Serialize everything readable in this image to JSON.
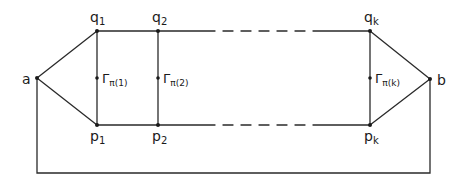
{
  "diagram": {
    "type": "graph",
    "stroke_color": "#2a2a2a",
    "vertices": {
      "a": {
        "label": "a",
        "x": 37,
        "y": 78
      },
      "b": {
        "label": "b",
        "x": 430,
        "y": 79
      },
      "q1": {
        "label": "q",
        "sub": "1",
        "x": 97,
        "y": 31
      },
      "p1": {
        "label": "p",
        "sub": "1",
        "x": 97,
        "y": 125
      },
      "q2": {
        "label": "q",
        "sub": "2",
        "x": 158,
        "y": 31
      },
      "p2": {
        "label": "p",
        "sub": "2",
        "x": 158,
        "y": 125
      },
      "qk": {
        "label": "q",
        "sub": "k",
        "x": 370,
        "y": 31
      },
      "pk": {
        "label": "p",
        "sub": "k",
        "x": 370,
        "y": 125
      }
    },
    "rungs": [
      {
        "label": "Γ",
        "sub": "π(1)",
        "x": 97,
        "y": 78
      },
      {
        "label": "Γ",
        "sub": "π(2)",
        "x": 158,
        "y": 78
      },
      {
        "label": "Γ",
        "sub": "π(k)",
        "x": 370,
        "y": 78
      }
    ],
    "edges": [
      [
        "a",
        "q1"
      ],
      [
        "a",
        "p1"
      ],
      [
        "q1",
        "p1"
      ],
      [
        "q2",
        "p2"
      ],
      [
        "qk",
        "pk"
      ],
      [
        "q1",
        "q2"
      ],
      [
        "p1",
        "p2"
      ],
      [
        "qk",
        "b"
      ],
      [
        "pk",
        "b"
      ],
      [
        "a",
        "b (via bottom path)"
      ]
    ],
    "dashed_segments": [
      "q2 … qk",
      "p2 … pk"
    ],
    "bottom_path_y": 173
  }
}
